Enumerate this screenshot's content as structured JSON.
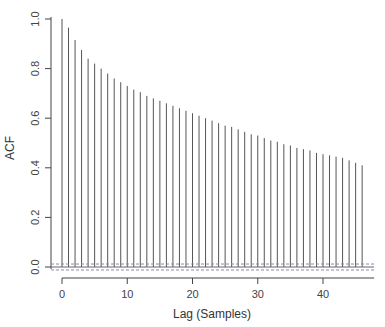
{
  "chart_data": {
    "type": "bar",
    "subtype": "acf-stem",
    "title": "",
    "xlabel": "Lag (Samples)",
    "ylabel": "ACF",
    "xlim": [
      -2,
      48
    ],
    "ylim": [
      -0.03,
      1.0
    ],
    "xticks": [
      0,
      10,
      20,
      30,
      40
    ],
    "yticks": [
      0.0,
      0.2,
      0.4,
      0.6,
      0.8,
      1.0
    ],
    "ytick_labels": [
      "0.0",
      "0.2",
      "0.4",
      "0.6",
      "0.8",
      "1.0"
    ],
    "grid": false,
    "legend": null,
    "x": [
      0,
      1,
      2,
      3,
      4,
      5,
      6,
      7,
      8,
      9,
      10,
      11,
      12,
      13,
      14,
      15,
      16,
      17,
      18,
      19,
      20,
      21,
      22,
      23,
      24,
      25,
      26,
      27,
      28,
      29,
      30,
      31,
      32,
      33,
      34,
      35,
      36,
      37,
      38,
      39,
      40,
      41,
      42,
      43,
      44,
      45,
      46
    ],
    "values": [
      1.0,
      0.965,
      0.915,
      0.875,
      0.84,
      0.82,
      0.8,
      0.78,
      0.76,
      0.745,
      0.73,
      0.715,
      0.705,
      0.69,
      0.68,
      0.67,
      0.66,
      0.65,
      0.64,
      0.63,
      0.62,
      0.61,
      0.6,
      0.59,
      0.58,
      0.57,
      0.565,
      0.555,
      0.545,
      0.535,
      0.53,
      0.52,
      0.51,
      0.505,
      0.495,
      0.49,
      0.48,
      0.475,
      0.47,
      0.46,
      0.455,
      0.45,
      0.445,
      0.44,
      0.43,
      0.42,
      0.41
    ],
    "confidence_bounds": [
      -0.012,
      0.012
    ],
    "colors": {
      "stem": "#555555",
      "bounds": "#8a8aa8",
      "axis": "#444444"
    }
  }
}
